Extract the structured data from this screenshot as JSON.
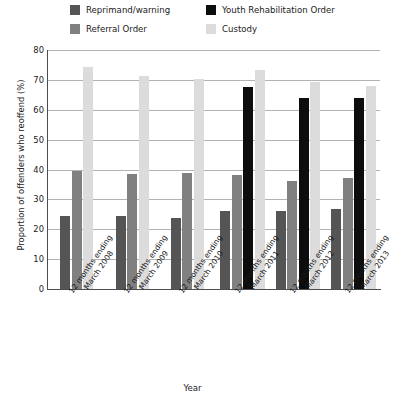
{
  "chart_data": {
    "type": "bar",
    "title": "",
    "xlabel": "Year",
    "ylabel": "Proportion of offenders who reoffend (%)",
    "ylim": [
      0,
      80
    ],
    "ytick_step": 10,
    "yticks": [
      0,
      10,
      20,
      30,
      40,
      50,
      60,
      70,
      80
    ],
    "grid": true,
    "legend_position": "top",
    "categories": [
      "12 months ending March 2008",
      "12 months ending March 2009",
      "12 months ending March 2010",
      "12 months ending March 2011",
      "12 months ending March 2012",
      "12 months ending March 2013"
    ],
    "category_lines": [
      [
        "12 months ending",
        "March 2008"
      ],
      [
        "12 months ending",
        "March 2009"
      ],
      [
        "12 months ending",
        "March 2010"
      ],
      [
        "12 months ending",
        "March 2011"
      ],
      [
        "12 months ending",
        "March 2012"
      ],
      [
        "12 months ending",
        "March 2013"
      ]
    ],
    "series": [
      {
        "name": "Reprimand/warning",
        "color": "#555555",
        "values": [
          24.5,
          24.3,
          23.8,
          26.2,
          26.0,
          26.8
        ]
      },
      {
        "name": "Referral Order",
        "color": "#808080",
        "values": [
          39.5,
          38.5,
          38.7,
          38.0,
          36.0,
          37.2
        ]
      },
      {
        "name": "Youth Rehabilitation Order",
        "color": "#0d0d0d",
        "values": [
          null,
          null,
          null,
          67.7,
          63.8,
          63.8
        ]
      },
      {
        "name": "Custody",
        "color": "#dcdcdc",
        "values": [
          74.2,
          71.3,
          70.2,
          73.2,
          69.2,
          68.0
        ]
      }
    ]
  },
  "legend": {
    "items": [
      {
        "label": "Reprimand/warning",
        "color": "#555555"
      },
      {
        "label": "Referral Order",
        "color": "#808080"
      },
      {
        "label": "Youth Rehabilitation Order",
        "color": "#0d0d0d"
      },
      {
        "label": "Custody",
        "color": "#dcdcdc"
      }
    ]
  },
  "axes": {
    "y_title": "Proportion of offenders who reoffend (%)",
    "x_title": "Year"
  }
}
